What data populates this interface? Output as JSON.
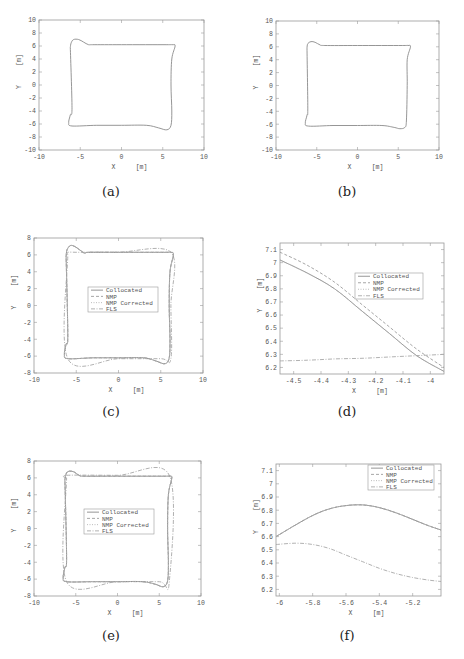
{
  "figure": {
    "captions": [
      "(a)",
      "(b)",
      "(c)",
      "(d)",
      "(e)",
      "(f)"
    ]
  },
  "legend_labels": [
    "Collocated",
    "NMP",
    "NMP Corrected",
    "FLS"
  ],
  "colors": {
    "axes": "#9a9a9a",
    "collocated": "#8a8a8a",
    "nmp": "#9c9c9c",
    "nmp_corrected": "#b5b5b5",
    "fls": "#a8a8a8",
    "text": "#555555"
  },
  "chart_data": [
    {
      "id": "a",
      "type": "line",
      "title": "",
      "xlabel": "X [m]",
      "ylabel": "Y [m]",
      "xlim": [
        -10,
        10
      ],
      "ylim": [
        -10,
        10
      ],
      "xticks": [
        -10,
        -5,
        0,
        5,
        10
      ],
      "yticks": [
        -10,
        -8,
        -6,
        -4,
        -2,
        0,
        2,
        4,
        6,
        8,
        10
      ],
      "grid": false,
      "legend": null,
      "series": [
        {
          "name": "trajectory",
          "x": [
            -6.2,
            -6.1,
            -5.8,
            -5.2,
            -4.6,
            -4.0,
            -3.5,
            0,
            5.5,
            6.2,
            6.5,
            6.1,
            6.0,
            6.1,
            6.0,
            5.5,
            4.5,
            3.0,
            0,
            -3.0,
            -6.0,
            -6.4,
            -6.2,
            -6.0,
            -6.2
          ],
          "y": [
            5.8,
            6.5,
            7.0,
            7.0,
            6.6,
            6.2,
            6.2,
            6.2,
            6.2,
            6.2,
            6.0,
            4.0,
            0,
            -4.0,
            -6.2,
            -6.9,
            -6.6,
            -6.2,
            -6.2,
            -6.2,
            -6.3,
            -5.8,
            -4.6,
            -3.5,
            5.8
          ]
        }
      ]
    },
    {
      "id": "b",
      "type": "line",
      "title": "",
      "xlabel": "X [m]",
      "ylabel": "Y [m]",
      "xlim": [
        -10,
        10
      ],
      "ylim": [
        -10,
        10
      ],
      "xticks": [
        -10,
        -5,
        0,
        5,
        10
      ],
      "yticks": [
        -10,
        -8,
        -6,
        -4,
        -2,
        0,
        2,
        4,
        6,
        8,
        10
      ],
      "grid": false,
      "legend": null,
      "series": [
        {
          "name": "trajectory",
          "x": [
            -6.2,
            -6.1,
            -5.7,
            -5.2,
            -4.6,
            -4.0,
            0,
            5.5,
            6.2,
            6.5,
            6.1,
            6.1,
            6.0,
            5.8,
            5.2,
            4.5,
            3.0,
            0,
            -3.0,
            -6.0,
            -6.4,
            -6.2,
            -6.1,
            -6.2
          ],
          "y": [
            5.8,
            6.5,
            6.8,
            6.7,
            6.3,
            6.2,
            6.2,
            6.2,
            6.2,
            6.0,
            4.0,
            0,
            -5.5,
            -6.5,
            -6.7,
            -6.5,
            -6.2,
            -6.2,
            -6.2,
            -6.3,
            -5.8,
            -4.6,
            -3.5,
            5.8
          ]
        }
      ]
    },
    {
      "id": "c",
      "type": "line",
      "title": "",
      "xlabel": "X [m]",
      "ylabel": "Y [m]",
      "xlim": [
        -10,
        10
      ],
      "ylim": [
        -8,
        8
      ],
      "xticks": [
        -10,
        -5,
        0,
        5,
        10
      ],
      "yticks": [
        -8,
        -6,
        -4,
        -2,
        0,
        2,
        4,
        6,
        8
      ],
      "grid": false,
      "legend": {
        "position": "center",
        "entries": [
          "Collocated",
          "NMP",
          "NMP Corrected",
          "FLS"
        ]
      },
      "series": [
        {
          "name": "Collocated",
          "x": [
            -6.2,
            -6.1,
            -5.7,
            -5.2,
            -4.6,
            -4.0,
            -3.5,
            0,
            5.5,
            6.2,
            6.5,
            6.1,
            6.0,
            6.1,
            6.0,
            5.5,
            4.5,
            3.0,
            0,
            -3.0,
            -6.0,
            -6.4,
            -6.2,
            -6.0,
            -6.2
          ],
          "y": [
            5.8,
            6.6,
            7.1,
            7.0,
            6.6,
            6.2,
            6.3,
            6.3,
            6.3,
            6.3,
            6.0,
            4.0,
            0,
            -4.0,
            -6.2,
            -6.9,
            -6.6,
            -6.2,
            -6.2,
            -6.2,
            -6.3,
            -5.8,
            -4.6,
            -3.5,
            5.8
          ]
        },
        {
          "name": "NMP",
          "x": [
            -6.2,
            -6.1,
            -5.7,
            -5.2,
            -4.6,
            -4.0,
            -3.5,
            0,
            5.5,
            6.2,
            6.5,
            6.1,
            6.0,
            6.1,
            6.0,
            5.5,
            4.5,
            3.0,
            0,
            -3.0,
            -6.0,
            -6.4,
            -6.2,
            -6.0,
            -6.2
          ],
          "y": [
            5.8,
            6.6,
            7.1,
            7.0,
            6.6,
            6.2,
            6.3,
            6.3,
            6.3,
            6.3,
            6.0,
            4.0,
            0,
            -4.0,
            -6.2,
            -6.9,
            -6.6,
            -6.2,
            -6.2,
            -6.2,
            -6.3,
            -5.8,
            -4.6,
            -3.5,
            5.8
          ]
        },
        {
          "name": "NMP Corrected",
          "x": [
            -6.2,
            -6.1,
            -5.7,
            -5.2,
            -4.6,
            -4.0,
            -3.5,
            0,
            5.5,
            6.2,
            6.5,
            6.1,
            6.0,
            6.1,
            6.0,
            5.5,
            4.5,
            3.0,
            0,
            -3.0,
            -6.0,
            -6.4,
            -6.2,
            -6.0,
            -6.2
          ],
          "y": [
            5.8,
            6.6,
            7.1,
            7.0,
            6.6,
            6.2,
            6.3,
            6.3,
            6.3,
            6.3,
            6.0,
            4.0,
            0,
            -4.0,
            -6.2,
            -6.9,
            -6.6,
            -6.2,
            -6.2,
            -6.2,
            -6.3,
            -5.8,
            -4.6,
            -3.5,
            5.8
          ]
        },
        {
          "name": "FLS",
          "x": [
            -6.0,
            -6.0,
            -5.0,
            -4.0,
            0,
            6.2,
            6.2,
            6.2,
            5.0,
            0,
            -6.0,
            -6.0
          ],
          "y": [
            6.0,
            6.3,
            6.3,
            6.3,
            6.3,
            6.3,
            0,
            -6.3,
            -6.3,
            -6.3,
            -6.3,
            6.0
          ]
        }
      ]
    },
    {
      "id": "d",
      "type": "line",
      "title": "",
      "xlabel": "X [m]",
      "ylabel": "Y [m]",
      "xlim": [
        -4.55,
        -3.95
      ],
      "ylim": [
        6.15,
        7.15
      ],
      "xticks": [
        -4.5,
        -4.4,
        -4.3,
        -4.2,
        -4.1,
        -4.0
      ],
      "xticklabels": [
        "-4.5",
        "-4.4",
        "-4.3",
        "-4.2",
        "-4.1",
        "-4"
      ],
      "yticks": [
        6.2,
        6.3,
        6.4,
        6.5,
        6.6,
        6.7,
        6.8,
        6.9,
        7.0,
        7.1
      ],
      "yticklabels": [
        "6.2",
        "6.3",
        "6.4",
        "6.5",
        "6.6",
        "6.7",
        "6.8",
        "6.9",
        "7",
        "7.1"
      ],
      "grid": false,
      "legend": {
        "position": "upper right (inset)",
        "entries": [
          "Collocated",
          "NMP",
          "NMP Corrected",
          "FLS"
        ]
      },
      "series": [
        {
          "name": "Collocated",
          "x": [
            -4.55,
            -4.45,
            -4.35,
            -4.25,
            -4.15,
            -4.05,
            -3.95
          ],
          "y": [
            7.02,
            6.92,
            6.8,
            6.63,
            6.46,
            6.29,
            6.17
          ]
        },
        {
          "name": "NMP",
          "x": [
            -4.55,
            -4.45,
            -4.35,
            -4.25,
            -4.15,
            -4.05,
            -3.95
          ],
          "y": [
            7.08,
            6.98,
            6.85,
            6.68,
            6.51,
            6.34,
            6.2
          ]
        },
        {
          "name": "NMP Corrected",
          "x": [
            -4.55,
            -4.45,
            -4.35,
            -4.25,
            -4.15,
            -4.05,
            -3.95
          ],
          "y": [
            7.02,
            6.92,
            6.8,
            6.63,
            6.46,
            6.29,
            6.17
          ]
        },
        {
          "name": "FLS",
          "x": [
            -4.55,
            -4.45,
            -4.35,
            -4.25,
            -4.15,
            -4.05,
            -3.95
          ],
          "y": [
            6.25,
            6.255,
            6.265,
            6.27,
            6.28,
            6.29,
            6.3
          ]
        }
      ]
    },
    {
      "id": "e",
      "type": "line",
      "title": "",
      "xlabel": "X [m]",
      "ylabel": "Y [m]",
      "xlim": [
        -10,
        10
      ],
      "ylim": [
        -8,
        8
      ],
      "xticks": [
        -10,
        -5,
        0,
        5,
        10
      ],
      "yticks": [
        -8,
        -6,
        -4,
        -2,
        0,
        2,
        4,
        6,
        8
      ],
      "grid": false,
      "legend": {
        "position": "center",
        "entries": [
          "Collocated",
          "NMP",
          "NMP Corrected",
          "FLS"
        ]
      },
      "series": [
        {
          "name": "Collocated",
          "x": [
            -6.3,
            -6.1,
            -5.7,
            -5.2,
            -4.6,
            -4.0,
            0,
            5.5,
            6.2,
            6.5,
            6.1,
            6.0,
            6.1,
            6.0,
            5.5,
            4.5,
            3.0,
            0,
            -3.0,
            -6.1,
            -6.5,
            -6.3,
            -6.1,
            -6.3
          ],
          "y": [
            5.8,
            6.6,
            6.8,
            6.7,
            6.3,
            6.2,
            6.2,
            6.2,
            6.2,
            6.0,
            4.0,
            0,
            -4.0,
            -6.2,
            -6.9,
            -6.6,
            -6.3,
            -6.3,
            -6.3,
            -6.3,
            -5.8,
            -4.6,
            -3.5,
            5.8
          ]
        },
        {
          "name": "NMP",
          "x": [
            -6.3,
            -6.1,
            -5.7,
            -5.2,
            -4.6,
            -4.0,
            0,
            5.5,
            6.2,
            6.5,
            6.1,
            6.0,
            6.1,
            6.0,
            5.5,
            4.5,
            3.0,
            0,
            -3.0,
            -6.1,
            -6.5,
            -6.3,
            -6.1,
            -6.3
          ],
          "y": [
            5.8,
            6.6,
            6.8,
            6.7,
            6.3,
            6.2,
            6.2,
            6.2,
            6.2,
            6.0,
            4.0,
            0,
            -4.0,
            -6.2,
            -6.9,
            -6.6,
            -6.3,
            -6.3,
            -6.3,
            -6.3,
            -5.8,
            -4.6,
            -3.5,
            5.8
          ]
        },
        {
          "name": "NMP Corrected",
          "x": [
            -6.3,
            -6.1,
            -5.7,
            -5.2,
            -4.6,
            -4.0,
            0,
            5.5,
            6.2,
            6.5,
            6.1,
            6.0,
            6.1,
            6.0,
            5.5,
            4.5,
            3.0,
            0,
            -3.0,
            -6.1,
            -6.5,
            -6.3,
            -6.1,
            -6.3
          ],
          "y": [
            5.8,
            6.6,
            6.8,
            6.7,
            6.3,
            6.2,
            6.2,
            6.2,
            6.2,
            6.0,
            4.0,
            0,
            -4.0,
            -6.2,
            -6.9,
            -6.6,
            -6.3,
            -6.3,
            -6.3,
            -6.3,
            -5.8,
            -4.6,
            -3.5,
            5.8
          ]
        },
        {
          "name": "FLS",
          "x": [
            -6.1,
            -6.1,
            0,
            6.2,
            6.2,
            5.0,
            0,
            -6.1,
            -6.1
          ],
          "y": [
            6.0,
            6.3,
            6.3,
            6.3,
            -6.3,
            -6.3,
            -6.3,
            -6.3,
            6.0
          ]
        }
      ]
    },
    {
      "id": "f",
      "type": "line",
      "title": "",
      "xlabel": "X [m]",
      "ylabel": "Y [m]",
      "xlim": [
        -6.02,
        -5.03
      ],
      "ylim": [
        6.15,
        7.15
      ],
      "xticks": [
        -6.0,
        -5.8,
        -5.6,
        -5.4,
        -5.2
      ],
      "xticklabels": [
        "-6",
        "-5.8",
        "-5.6",
        "-5.4",
        "-5.2"
      ],
      "yticks": [
        6.2,
        6.3,
        6.4,
        6.5,
        6.6,
        6.7,
        6.8,
        6.9,
        7.0,
        7.1
      ],
      "yticklabels": [
        "6.2",
        "6.3",
        "6.4",
        "6.5",
        "6.6",
        "6.7",
        "6.8",
        "6.9",
        "7",
        "7.1"
      ],
      "grid": false,
      "legend": {
        "position": "upper right",
        "entries": [
          "Collocated",
          "NMP",
          "NMP Corrected",
          "FLS"
        ]
      },
      "series": [
        {
          "name": "Collocated",
          "x": [
            -6.02,
            -5.9,
            -5.8,
            -5.7,
            -5.6,
            -5.5,
            -5.4,
            -5.3,
            -5.2,
            -5.1,
            -5.03
          ],
          "y": [
            6.6,
            6.69,
            6.76,
            6.81,
            6.835,
            6.84,
            6.82,
            6.78,
            6.73,
            6.68,
            6.65
          ]
        },
        {
          "name": "NMP",
          "x": [
            -6.02,
            -5.9,
            -5.8,
            -5.7,
            -5.6,
            -5.5,
            -5.4,
            -5.3,
            -5.2,
            -5.1,
            -5.03
          ],
          "y": [
            6.6,
            6.69,
            6.76,
            6.81,
            6.835,
            6.84,
            6.82,
            6.78,
            6.73,
            6.68,
            6.65
          ]
        },
        {
          "name": "NMP Corrected",
          "x": [
            -6.02,
            -5.9,
            -5.8,
            -5.7,
            -5.6,
            -5.5,
            -5.4,
            -5.3,
            -5.2,
            -5.1,
            -5.03
          ],
          "y": [
            6.6,
            6.69,
            6.76,
            6.81,
            6.835,
            6.84,
            6.82,
            6.78,
            6.73,
            6.68,
            6.65
          ]
        },
        {
          "name": "FLS",
          "x": [
            -6.02,
            -5.9,
            -5.8,
            -5.7,
            -5.6,
            -5.5,
            -5.4,
            -5.3,
            -5.2,
            -5.1,
            -5.03
          ],
          "y": [
            6.54,
            6.55,
            6.54,
            6.51,
            6.46,
            6.41,
            6.36,
            6.32,
            6.29,
            6.27,
            6.26
          ]
        }
      ]
    }
  ]
}
